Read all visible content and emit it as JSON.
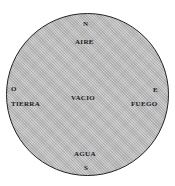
{
  "diagram": {
    "directions": {
      "north": "N",
      "south": "S",
      "east": "E",
      "west": "O"
    },
    "elements": {
      "top": "AIRE",
      "bottom": "AGUA",
      "left": "TIERRA",
      "right": "FUEGO",
      "center": "VACIO"
    }
  }
}
